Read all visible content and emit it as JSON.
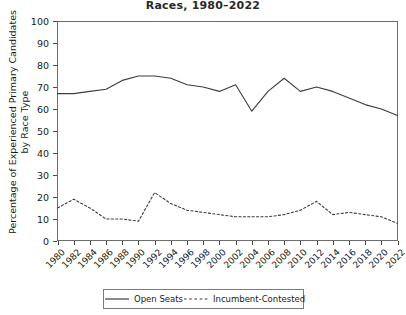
{
  "chart_data": {
    "type": "line",
    "title": "Races, 1980–2022",
    "xlabel": "",
    "ylabel": "Percentage of Experienced Primary Candidates by Race Type",
    "ylim": [
      0,
      100
    ],
    "yticks": [
      0,
      10,
      20,
      30,
      40,
      50,
      60,
      70,
      80,
      90,
      100
    ],
    "grid": false,
    "legend_position": "bottom",
    "categories": [
      1980,
      1982,
      1984,
      1986,
      1988,
      1990,
      1992,
      1994,
      1996,
      1998,
      2000,
      2002,
      2004,
      2006,
      2008,
      2010,
      2012,
      2014,
      2016,
      2018,
      2020,
      2022
    ],
    "series": [
      {
        "name": "Open Seats",
        "style": "solid",
        "color": "#3d3d3d",
        "values": [
          67,
          67,
          68,
          69,
          73,
          75,
          75,
          74,
          71,
          70,
          68,
          71,
          59,
          68,
          74,
          68,
          70,
          68,
          65,
          62,
          60,
          57
        ]
      },
      {
        "name": "Incumbent-Contested",
        "style": "dashed",
        "color": "#3d3d3d",
        "values": [
          15,
          19,
          15,
          10,
          10,
          9,
          22,
          17,
          14,
          13,
          12,
          11,
          11,
          11,
          12,
          14,
          18,
          12,
          13,
          12,
          11,
          8
        ]
      }
    ]
  },
  "legend": {
    "entries": [
      {
        "label": "Open Seats"
      },
      {
        "label": "Incumbent-Contested"
      }
    ]
  }
}
